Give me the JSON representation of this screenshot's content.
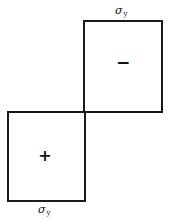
{
  "diagram": {
    "top_region": {
      "sign": "−",
      "label_symbol": "σ",
      "label_subscript": "y"
    },
    "bottom_region": {
      "sign": "+",
      "label_symbol": "σ",
      "label_subscript": "y"
    },
    "colors": {
      "line": "#1a1a1a",
      "background": "#ffffff"
    }
  }
}
